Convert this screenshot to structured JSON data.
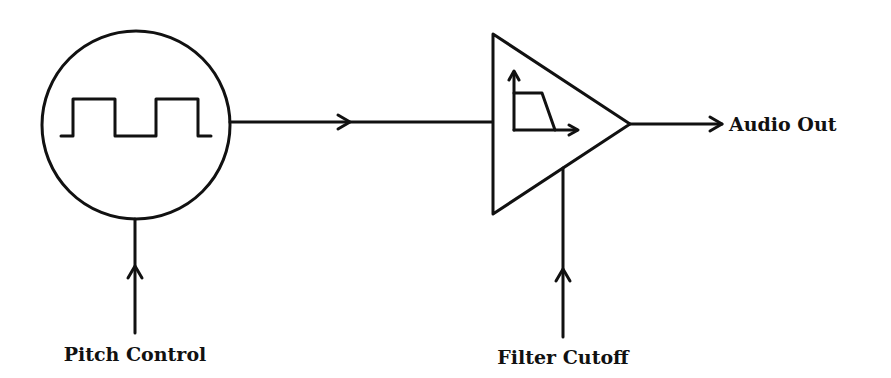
{
  "diagram": {
    "type": "signal-flow",
    "colors": {
      "stroke": "#111111",
      "fill": "#ffffff",
      "text": "#111111"
    },
    "nodes": [
      {
        "id": "oscillator",
        "shape": "circle",
        "icon": "square-wave-icon",
        "description": "Square wave oscillator"
      },
      {
        "id": "filter",
        "shape": "triangle",
        "icon": "lowpass-filter-icon",
        "description": "Low-pass filter / amplifier"
      }
    ],
    "labels": {
      "pitch_control": "Pitch Control",
      "filter_cutoff": "Filter Cutoff",
      "audio_out": "Audio Out"
    },
    "edges": [
      {
        "from": "pitch_control",
        "to": "oscillator",
        "label": "Pitch Control"
      },
      {
        "from": "oscillator",
        "to": "filter",
        "label": ""
      },
      {
        "from": "filter_cutoff",
        "to": "filter",
        "label": "Filter Cutoff"
      },
      {
        "from": "filter",
        "to": "audio_out",
        "label": "Audio Out"
      }
    ]
  }
}
